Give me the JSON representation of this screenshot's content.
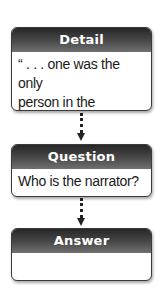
{
  "diagram": {
    "type": "flowchart",
    "boxes": [
      {
        "title": "Detail",
        "body_lines": [
          "“ . . . one was the only",
          "person in the drawing",
          "room . . .”"
        ]
      },
      {
        "title": "Question",
        "body_lines": [
          "Who is the narrator?"
        ]
      },
      {
        "title": "Answer",
        "body_lines": []
      }
    ],
    "connectors": [
      {
        "from": "Detail",
        "to": "Question",
        "style": "dotted-arrow-down"
      },
      {
        "from": "Question",
        "to": "Answer",
        "style": "dotted-arrow-down"
      }
    ],
    "colors": {
      "header_top": "#262626",
      "header_bottom": "#707070",
      "border": "#3a3a3a",
      "text": "#1a1a1a",
      "header_text": "#ffffff"
    }
  }
}
